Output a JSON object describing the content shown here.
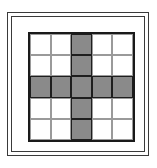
{
  "diagram": {
    "type": "grid",
    "rows": 5,
    "cols": 5,
    "colors": {
      "shaded": "#8a8a8a",
      "empty": "#ffffff",
      "border": "#1a1a1a"
    },
    "cells": [
      [
        0,
        0,
        1,
        0,
        0
      ],
      [
        0,
        0,
        1,
        0,
        0
      ],
      [
        1,
        1,
        1,
        1,
        1
      ],
      [
        0,
        0,
        1,
        0,
        0
      ],
      [
        0,
        0,
        1,
        0,
        0
      ]
    ]
  }
}
